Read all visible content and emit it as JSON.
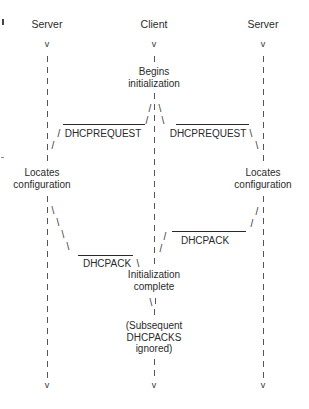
{
  "columns": {
    "left": {
      "label": "Server",
      "x": 47
    },
    "center": {
      "label": "Client",
      "x": 154
    },
    "right": {
      "label": "Server",
      "x": 263
    }
  },
  "client_events": {
    "begins": [
      "Begins",
      "initialization"
    ],
    "complete": [
      "Initialization",
      "complete"
    ],
    "ignored": [
      "(Subsequent",
      "DHCPACKS",
      "ignored)"
    ]
  },
  "server_events": {
    "left_locates": [
      "Locates",
      "configuration"
    ],
    "right_locates": [
      "Locates",
      "configuration"
    ]
  },
  "messages": {
    "request_left": "DHCPREQUEST",
    "request_right": "DHCPREQUEST",
    "ack_right": "DHCPACK",
    "ack_left": "DHCPACK"
  },
  "arrow_glyph": "v",
  "slash_glyph": "/",
  "backslash_glyph": "\\"
}
